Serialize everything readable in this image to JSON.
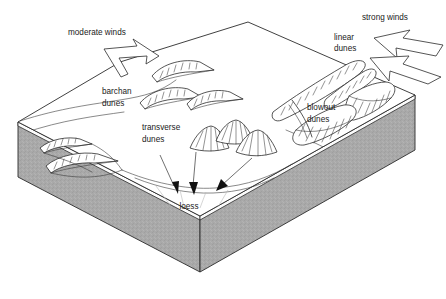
{
  "figure": {
    "background_color": "#ffffff",
    "line_color": "#2b2b2b",
    "ground_fill_color": "#a9a9a9",
    "top_surface_color": "#ffffff"
  },
  "labels": {
    "moderate_winds": "moderate winds",
    "strong_winds": "strong winds",
    "barchan_line1": "barchan",
    "barchan_line2": "dunes",
    "transverse_line1": "transverse",
    "transverse_line2": "dunes",
    "linear_line1": "linear",
    "linear_line2": "dunes",
    "blowout_line1": "blowout",
    "blowout_line2": "dunes",
    "loess": "loess"
  },
  "features": [
    {
      "name": "moderate-winds-arrow",
      "kind": "wind-arrow",
      "direction": "down-right",
      "strength": "moderate"
    },
    {
      "name": "strong-winds-arrow",
      "kind": "wind-arrow",
      "direction": "left",
      "strength": "strong"
    },
    {
      "name": "barchan-dunes",
      "kind": "dune",
      "count": 5,
      "form": "crescent"
    },
    {
      "name": "transverse-dunes",
      "kind": "dune",
      "count": 3,
      "form": "ridge-mound"
    },
    {
      "name": "linear-dunes",
      "kind": "dune",
      "count": 2,
      "form": "elongate-ridge"
    },
    {
      "name": "blowout-dunes",
      "kind": "dune",
      "count": 3,
      "form": "parabolic"
    },
    {
      "name": "loess-deposit",
      "kind": "deposit",
      "arrows": 3
    }
  ]
}
